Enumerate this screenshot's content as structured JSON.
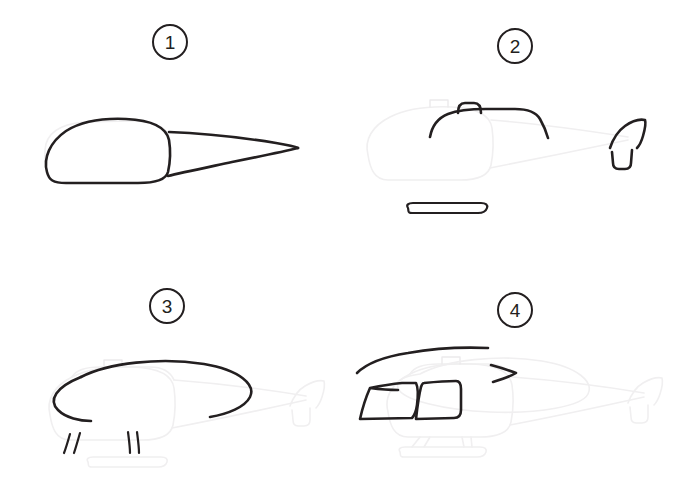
{
  "sheet": {
    "title": "How to draw a helicopter - 4 step tutorial",
    "background_color": "#ffffff",
    "ink_color": "#231f20",
    "ghost_color": "#f0eff0",
    "width": 679,
    "height": 477
  },
  "panels": [
    {
      "number": "1",
      "name": "step-1",
      "caption": "Draw the cabin body and the tapering tail boom",
      "new_parts": [
        "cabin-body-outline",
        "tail-boom-outline"
      ]
    },
    {
      "number": "2",
      "name": "step-2",
      "caption": "Add the cabin roof with rotor mast, the tail fin and the landing skid",
      "new_parts": [
        "cabin-roof-line",
        "rotor-mast-hump",
        "tail-fin-upper",
        "tail-fin-lower",
        "landing-skid"
      ]
    },
    {
      "number": "3",
      "name": "step-3",
      "caption": "Draw the main rotor disc ellipse and the skid support struts",
      "new_parts": [
        "rotor-disc-ellipse",
        "skid-strut-front-pair",
        "skid-strut-rear-pair"
      ]
    },
    {
      "number": "4",
      "name": "step-4",
      "caption": "Add the rotor blades, the cockpit window and the door window",
      "new_parts": [
        "rotor-blade-left",
        "rotor-blade-right",
        "cockpit-window",
        "door-window"
      ]
    }
  ]
}
